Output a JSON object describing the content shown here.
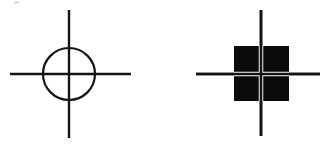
{
  "figure": {
    "background_color": "#ffffff",
    "stroke_color": "#141414",
    "fill_color": "#0b0b0b",
    "knockout_color": "#ffffff",
    "canvas": {
      "width": 327,
      "height": 144
    },
    "artifact": {
      "name": "faint-corner-speck",
      "x": 14,
      "y": 1,
      "width": 5,
      "height": 3,
      "color": "#c9c9c9"
    },
    "items": [
      {
        "id": "circle-crosshair",
        "label": "Circle crosshair",
        "shape": "circle",
        "center_x": 69,
        "center_y": 74,
        "radius": 26,
        "stroke_width": 2.2,
        "filled": false,
        "vertical_line": {
          "x": 69,
          "y1": 10,
          "y2": 138,
          "width": 2.4
        },
        "horizontal_line": {
          "y": 74,
          "x1": 10,
          "x2": 131,
          "width": 2.4
        },
        "lines_over_shape": true
      },
      {
        "id": "square-crosshair",
        "label": "Quartered square crosshair",
        "shape": "square",
        "center_x": 261,
        "center_y": 74,
        "left": 234,
        "top": 46,
        "size": 55,
        "stroke_width": 0,
        "filled": true,
        "gap_width": 4.5,
        "vertical_line": {
          "x": 261,
          "y1": 10,
          "y2": 136,
          "width": 2.6
        },
        "horizontal_line": {
          "y": 74,
          "x1": 196,
          "x2": 320,
          "width": 2.6
        },
        "lines_over_shape": false,
        "quadrants": 4
      }
    ]
  }
}
